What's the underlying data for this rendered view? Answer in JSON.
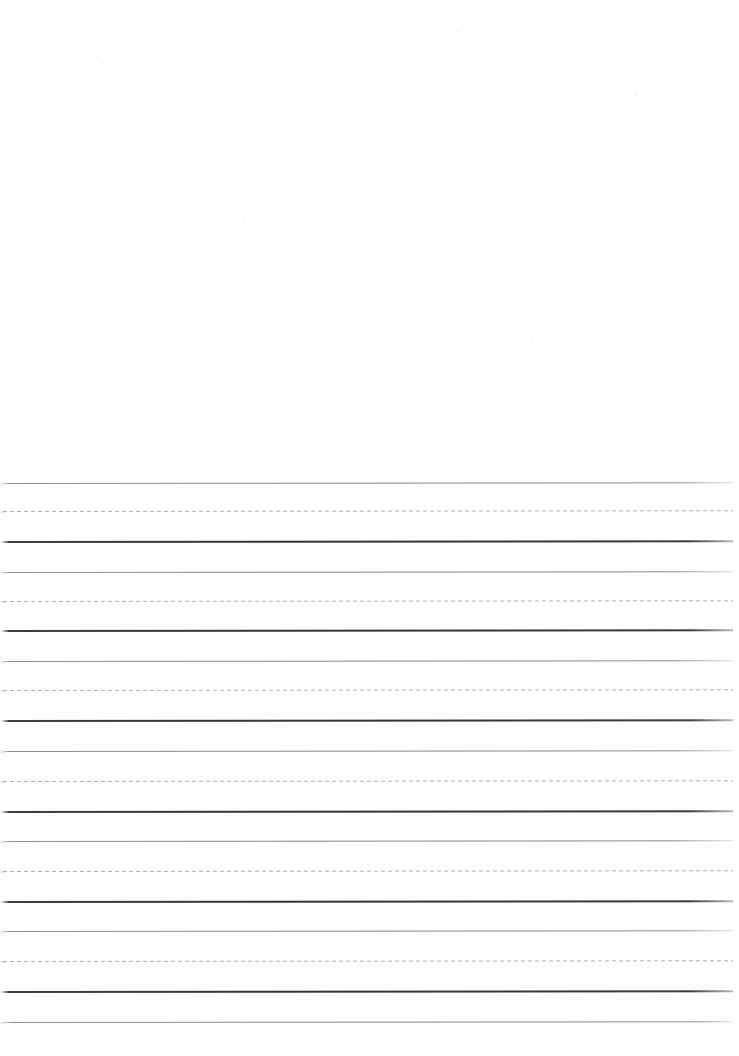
{
  "document": {
    "type": "handwriting-practice-sheet",
    "title": "Primary Handwriting Practice Paper",
    "page_width": 739,
    "page_height": 1056,
    "background_color": "#fefefe",
    "orientation": "portrait",
    "visible_text": "",
    "has_written_content": false
  },
  "blank_zone": {
    "label": "Unruled blank area",
    "top": 0,
    "height": 470
  },
  "ruling": {
    "label": "Ruled writing area",
    "style": "three-line dotted-midline handwriting rule",
    "first_line_y": 483,
    "line_spacing_px": 30,
    "group_pitch_px": 89,
    "left_margin_px": 3,
    "right_margin_px": 6,
    "line_length_px": 730,
    "group_count": 6,
    "total_line_count": 19,
    "colors": {
      "topline": "#85878e",
      "midline": "#a9abb2",
      "baseline": "#313338",
      "trailing": "#85878e"
    },
    "line_roles": [
      "topline",
      "midline",
      "baseline"
    ],
    "dash_pattern": {
      "dash_px": 4,
      "gap_px": 3
    },
    "line_weights": {
      "topline": 1,
      "midline": 1,
      "baseline": 2,
      "trailing": 1
    },
    "groups": [
      {
        "name": "writing-row-1",
        "top": 483,
        "lines": [
          {
            "role": "topline",
            "y": 483
          },
          {
            "role": "midline",
            "y": 511
          },
          {
            "role": "baseline",
            "y": 541
          }
        ]
      },
      {
        "name": "writing-row-2",
        "top": 572,
        "lines": [
          {
            "role": "topline",
            "y": 572
          },
          {
            "role": "midline",
            "y": 601
          },
          {
            "role": "baseline",
            "y": 630
          }
        ]
      },
      {
        "name": "writing-row-3",
        "top": 661,
        "lines": [
          {
            "role": "topline",
            "y": 661
          },
          {
            "role": "midline",
            "y": 690
          },
          {
            "role": "baseline",
            "y": 720
          }
        ]
      },
      {
        "name": "writing-row-4",
        "top": 751,
        "lines": [
          {
            "role": "topline",
            "y": 751
          },
          {
            "role": "midline",
            "y": 781
          },
          {
            "role": "baseline",
            "y": 811
          }
        ]
      },
      {
        "name": "writing-row-5",
        "top": 841,
        "lines": [
          {
            "role": "topline",
            "y": 841
          },
          {
            "role": "midline",
            "y": 871
          },
          {
            "role": "baseline",
            "y": 901
          }
        ]
      },
      {
        "name": "writing-row-6",
        "top": 931,
        "lines": [
          {
            "role": "topline",
            "y": 931
          },
          {
            "role": "midline",
            "y": 961
          },
          {
            "role": "baseline",
            "y": 991
          }
        ]
      }
    ],
    "trailing_line": {
      "name": "closing-rule",
      "role": "trailing",
      "y": 1022
    }
  }
}
